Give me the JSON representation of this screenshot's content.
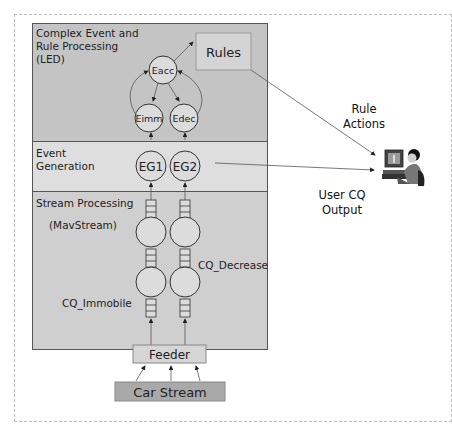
{
  "layers": {
    "led": {
      "label_line1": "Complex Event and",
      "label_line2": "Rule Processing",
      "label_line3": "(LED)"
    },
    "event_generation": {
      "label_line1": "Event",
      "label_line2": "Generation"
    },
    "stream_processing": {
      "label_line1": "Stream Processing",
      "label_line2": "(MavStream)"
    }
  },
  "nodes": {
    "eacc": "Eacc",
    "eimm": "Eimm",
    "edec": "Edec",
    "eg1": "EG1",
    "eg2": "EG2",
    "rules": "Rules",
    "feeder": "Feeder",
    "car_stream": "Car Stream"
  },
  "queries": {
    "cq_immobile": "CQ_Immobile",
    "cq_decrease": "CQ_Decrease"
  },
  "external": {
    "rule_actions_line1": "Rule",
    "rule_actions_line2": "Actions",
    "user_output_line1": "User CQ",
    "user_output_line2": "Output",
    "user_icon": "user-at-computer-icon"
  },
  "colors": {
    "led_band": "#c4c4c4",
    "event_band": "#dedede",
    "stream_band": "#cfcfcf",
    "rules_box": "#d4d4d4",
    "car_stream_box": "#a9a9a9",
    "node_fill": "#dcdcdc",
    "stroke": "#333333"
  }
}
